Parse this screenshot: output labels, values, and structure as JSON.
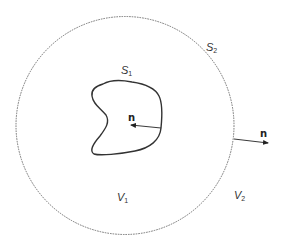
{
  "diagram": {
    "outer_surface": {
      "label": "S",
      "subscript": "2",
      "style": "dashed"
    },
    "inner_surface": {
      "label": "S",
      "subscript": "1",
      "style": "solid"
    },
    "inner_volume": {
      "label": "V",
      "subscript": "1"
    },
    "outer_volume": {
      "label": "V",
      "subscript": "2"
    },
    "inner_normal": {
      "label": "n"
    },
    "outer_normal": {
      "label": "n"
    },
    "colors": {
      "stroke": "#333333",
      "dashed_stroke": "#666666",
      "background": "#ffffff"
    }
  }
}
